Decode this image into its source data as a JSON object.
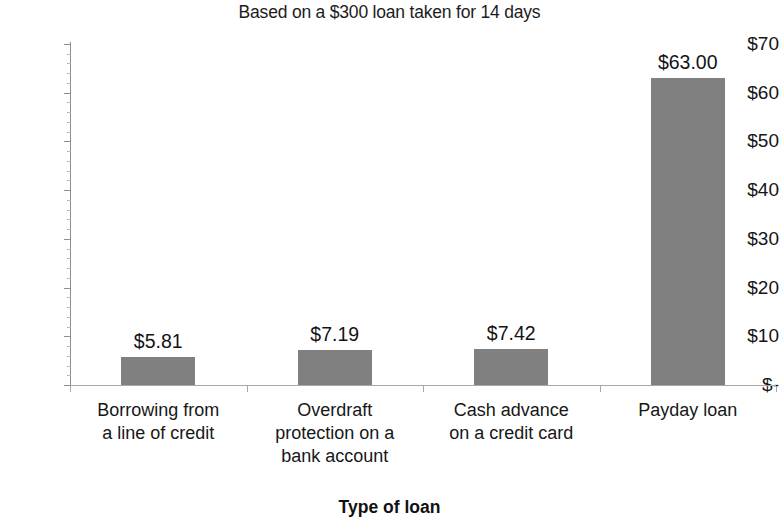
{
  "chart_data": {
    "type": "bar",
    "title": "Based on a $300 loan taken for 14 days",
    "xlabel": "Type of loan",
    "ylabel": "",
    "categories": [
      "Borrowing from a line of credit",
      "Overdraft protection on a bank account",
      "Cash advance on a credit card",
      "Payday loan"
    ],
    "category_lines": [
      [
        "Borrowing from",
        "a line of credit"
      ],
      [
        "Overdraft",
        "protection on a",
        "bank account"
      ],
      [
        "Cash advance",
        "on a credit card"
      ],
      [
        "Payday loan"
      ]
    ],
    "values": [
      5.81,
      7.19,
      7.42,
      63.0
    ],
    "data_labels": [
      "$5.81",
      "$7.19",
      "$7.42",
      "$63.00"
    ],
    "ylim": [
      0,
      70
    ],
    "y_ticks": [
      70,
      60,
      50,
      40,
      30,
      20,
      10,
      0
    ],
    "y_tick_labels": [
      "$70",
      "$60",
      "$50",
      "$40",
      "$30",
      "$20",
      "$10",
      "$-"
    ],
    "grid": false,
    "legend": false,
    "legend_position": "none",
    "bar_color": "#808080",
    "axis_color": "#8d8d8d",
    "text_color": "#151515"
  }
}
